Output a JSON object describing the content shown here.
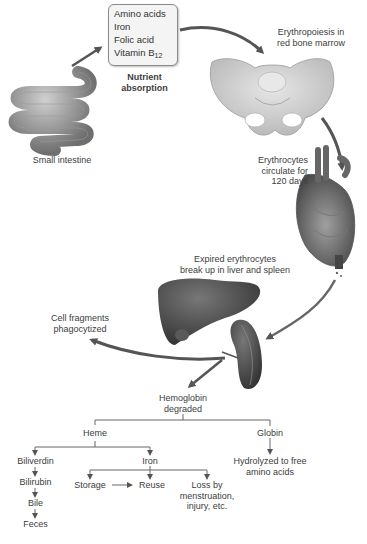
{
  "diagram": {
    "nutrient_box": {
      "items": [
        "Amino acids",
        "Iron",
        "Folic acid",
        "Vitamin B"
      ],
      "vitamin_subscript": "12"
    },
    "stages": {
      "nutrient_absorption": [
        "Nutrient",
        "absorption"
      ],
      "small_intestine": "Small intestine",
      "erythropoiesis": [
        "Erythropoiesis in",
        "red bone marrow"
      ],
      "circulation": [
        "Erythrocytes",
        "circulate for",
        "120 days"
      ],
      "breakup": [
        "Expired erythrocytes",
        "break up in liver and spleen"
      ],
      "phagocytized": [
        "Cell fragments",
        "phagocytized"
      ]
    },
    "organs": [
      "small-intestine",
      "pelvis",
      "heart",
      "liver",
      "spleen"
    ],
    "tree": {
      "root": [
        "Hemoglobin",
        "degraded"
      ],
      "heme": "Heme",
      "globin": "Globin",
      "globin_result": [
        "Hydrolyzed to free",
        "amino acids"
      ],
      "biliverdin": "Biliverdin",
      "bilirubin": "Bilirubin",
      "bile": "Bile",
      "feces": "Feces",
      "iron": "Iron",
      "storage": "Storage",
      "reuse": "Reuse",
      "loss": [
        "Loss by",
        "menstruation,",
        "injury, etc."
      ]
    },
    "colors": {
      "arrow": "#555555",
      "organ_dark": "#4a4a4a",
      "bone": "#cfcfcf",
      "text": "#3d3d3d"
    }
  }
}
